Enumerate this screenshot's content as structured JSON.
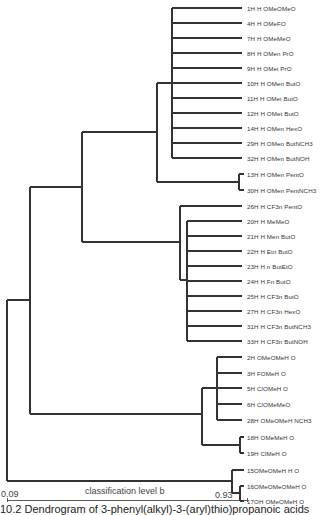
{
  "diagram": {
    "type": "dendrogram",
    "line_color": "#333333",
    "leaves": [
      {
        "label": "1H H OMeOMeO",
        "y": 8
      },
      {
        "label": "4H H OMeFO",
        "y": 23
      },
      {
        "label": "7H H OMeMeO",
        "y": 38
      },
      {
        "label": "8H H OMen PrO",
        "y": 53
      },
      {
        "label": "9H H OMei PrO",
        "y": 68
      },
      {
        "label": "10H H OMen ButO",
        "y": 83
      },
      {
        "label": "11H H OMei ButO",
        "y": 98
      },
      {
        "label": "12H H OMet ButO",
        "y": 113
      },
      {
        "label": "14H H OMen HexO",
        "y": 128
      },
      {
        "label": "29H H OMen ButNCH3",
        "y": 143
      },
      {
        "label": "32H H OMen ButNOH",
        "y": 158
      },
      {
        "label": "13H H OMen PentO",
        "y": 174
      },
      {
        "label": "30H H OMen PentNCH3",
        "y": 190
      },
      {
        "label": "26H H CF3n PentO",
        "y": 206
      },
      {
        "label": "20H H MeMeO",
        "y": 221
      },
      {
        "label": "21H H Men ButO",
        "y": 236
      },
      {
        "label": "22H H Etn ButO",
        "y": 251
      },
      {
        "label": "23H H n ButEtO",
        "y": 266
      },
      {
        "label": "24H H Fn ButO",
        "y": 281
      },
      {
        "label": "25H H CF3n ButO",
        "y": 296
      },
      {
        "label": "27H H CF3n HexO",
        "y": 311
      },
      {
        "label": "31H H CF3n ButNCH3",
        "y": 326
      },
      {
        "label": "33H H CF3n ButNOH",
        "y": 341
      },
      {
        "label": "2H OMeOMeH O",
        "y": 357
      },
      {
        "label": "3H FOMeH O",
        "y": 373
      },
      {
        "label": "5H ClOMeH O",
        "y": 388
      },
      {
        "label": "6H ClOMeMeO",
        "y": 404
      },
      {
        "label": "28H OMeOMeH NCH3",
        "y": 420
      },
      {
        "label": "18H OMeMeH O",
        "y": 437
      },
      {
        "label": "19H ClMeH O",
        "y": 453
      },
      {
        "label": "15OMeOMeH H O",
        "y": 470
      },
      {
        "label": "16OMeOMeOMeH O",
        "y": 486
      },
      {
        "label": "17OH OMeOMeH O",
        "y": 501
      }
    ],
    "axis": {
      "left_value": "0.09",
      "right_value": "0.93",
      "title": "classification level b"
    },
    "caption": "10.2  Dendrogram of 3-phenyl(alkyl)-3-(aryl)thio)propanoic acids"
  }
}
